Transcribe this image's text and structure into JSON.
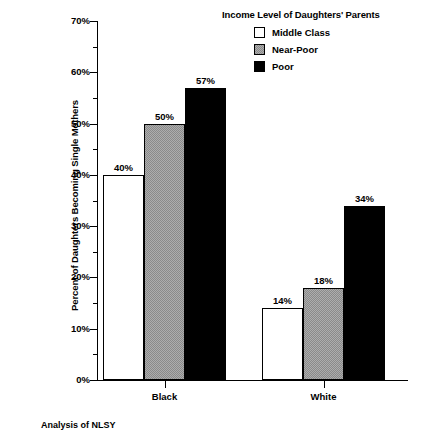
{
  "chart_data": {
    "type": "bar",
    "title": "",
    "xlabel": "",
    "ylabel": "Percent of Daughters Becoming Single Mothers",
    "categories": [
      "Black",
      "White"
    ],
    "ylim": [
      0,
      70
    ],
    "y_tick_labels": [
      "0%",
      "10%",
      "20%",
      "30%",
      "40%",
      "50%",
      "60%",
      "70%"
    ],
    "y_tick_values": [
      0,
      10,
      20,
      30,
      40,
      50,
      60,
      70
    ],
    "y_minor_tick_values": [
      5,
      15,
      25,
      35,
      45,
      55,
      65
    ],
    "grid": false,
    "legend_position": "top-right",
    "legend_title": "Income Level of Daughters' Parents",
    "series": [
      {
        "name": "Middle Class",
        "values": [
          40,
          14
        ],
        "labels": [
          "40%",
          "14%"
        ],
        "fill": "#ffffff",
        "swatch": "middle"
      },
      {
        "name": "Near-Poor",
        "values": [
          50,
          18
        ],
        "labels": [
          "50%",
          "18%"
        ],
        "fill": "#8a8a8a",
        "swatch": "nearpoor"
      },
      {
        "name": "Poor",
        "values": [
          57,
          34
        ],
        "labels": [
          "57%",
          "34%"
        ],
        "fill": "#000000",
        "swatch": "poor"
      }
    ],
    "footnote": "Analysis of NLSY"
  },
  "axis": {
    "y_title": "Percent of Daughters Becoming Single Mothers",
    "tick_0": "0%",
    "tick_10": "10%",
    "tick_20": "20%",
    "tick_30": "30%",
    "tick_40": "40%",
    "tick_50": "50%",
    "tick_60": "60%",
    "tick_70": "70%"
  },
  "legend": {
    "title": "Income Level of Daughters' Parents",
    "items": [
      {
        "label": "Middle Class"
      },
      {
        "label": "Near-Poor"
      },
      {
        "label": "Poor"
      }
    ]
  },
  "categories": [
    {
      "label": "Black"
    },
    {
      "label": "White"
    }
  ],
  "values": {
    "black_middle": "40%",
    "black_nearpoor": "50%",
    "black_poor": "57%",
    "white_middle": "14%",
    "white_nearpoor": "18%",
    "white_poor": "34%"
  },
  "footnote": "Analysis of NLSY"
}
